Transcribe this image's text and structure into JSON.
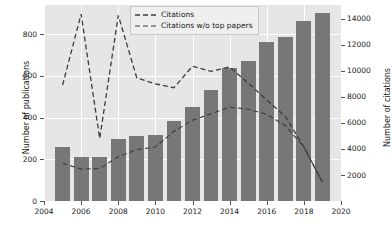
{
  "chart_data": {
    "type": "bar",
    "title": "",
    "xlabel": "",
    "ylabel": "Number of publications",
    "ylabel_right": "Number of citations",
    "grid": true,
    "legend_position": "upper center",
    "x": [
      2005,
      2006,
      2007,
      2008,
      2009,
      2010,
      2011,
      2012,
      2013,
      2014,
      2015,
      2016,
      2017,
      2018,
      2019
    ],
    "categories": [
      "2005",
      "2006",
      "2007",
      "2008",
      "2009",
      "2010",
      "2011",
      "2012",
      "2013",
      "2014",
      "2015",
      "2016",
      "2017",
      "2018",
      "2019"
    ],
    "values": [
      258,
      210,
      211,
      299,
      311,
      315,
      385,
      453,
      531,
      637,
      672,
      762,
      785,
      862,
      903
    ],
    "xlim": [
      2004,
      2020
    ],
    "ylim": [
      0,
      940
    ],
    "ylim_right": [
      0,
      15050
    ],
    "xticks": [
      2004,
      2006,
      2008,
      2010,
      2012,
      2014,
      2016,
      2018,
      2020
    ],
    "xticklabels": [
      "2004",
      "2006",
      "2008",
      "2010",
      "2012",
      "2014",
      "2016",
      "2018",
      "2020"
    ],
    "yticks": [
      0,
      200,
      400,
      600,
      800
    ],
    "yticklabels": [
      "0",
      "200",
      "400",
      "600",
      "800"
    ],
    "yticks_right": [
      2000,
      4000,
      6000,
      8000,
      10000,
      12000,
      14000
    ],
    "yticklabels_right": [
      "2000",
      "4000",
      "6000",
      "8000",
      "10000",
      "12000",
      "14000"
    ],
    "series": [
      {
        "name": "Publications",
        "kind": "bar",
        "axis": "left",
        "color": "#777777",
        "values": [
          258,
          210,
          211,
          299,
          311,
          315,
          385,
          453,
          531,
          637,
          672,
          762,
          785,
          862,
          903
        ]
      },
      {
        "name": "Citations",
        "kind": "line",
        "style": "dashed",
        "axis": "right",
        "color": "#3c3c3c",
        "x": [
          2005,
          2006,
          2007,
          2008,
          2009,
          2010,
          2011,
          2012,
          2013,
          2014,
          2015,
          2016,
          2017,
          2018,
          2019
        ],
        "values": [
          8900,
          14350,
          4800,
          14250,
          9450,
          9000,
          8700,
          10350,
          9950,
          10300,
          9050,
          7750,
          6500,
          4150,
          1450
        ]
      },
      {
        "name": "Citations w/o top papers",
        "kind": "line",
        "style": "dashed",
        "axis": "right",
        "color": "#3c3c3c",
        "x": [
          2005,
          2006,
          2007,
          2008,
          2009,
          2010,
          2011,
          2012,
          2013,
          2014,
          2015,
          2016,
          2017,
          2018,
          2019
        ],
        "values": [
          2900,
          2450,
          2500,
          3400,
          3950,
          4150,
          5350,
          6200,
          6700,
          7200,
          7050,
          6650,
          5800,
          4150,
          1450
        ]
      }
    ]
  },
  "legend": {
    "items": [
      {
        "label": "Citations",
        "dash": "dashed"
      },
      {
        "label": "Citations w/o top papers",
        "dash": "dashed"
      }
    ]
  },
  "axes": {
    "left_title": "Number of publications",
    "right_title": "Number of citations"
  },
  "colors": {
    "bar": "#777777",
    "line": "#3c3c3c",
    "plot_background": "#e6e6e6",
    "grid": "#ffffff",
    "figure_background": "#ffffff",
    "text": "#1a1a1a"
  }
}
